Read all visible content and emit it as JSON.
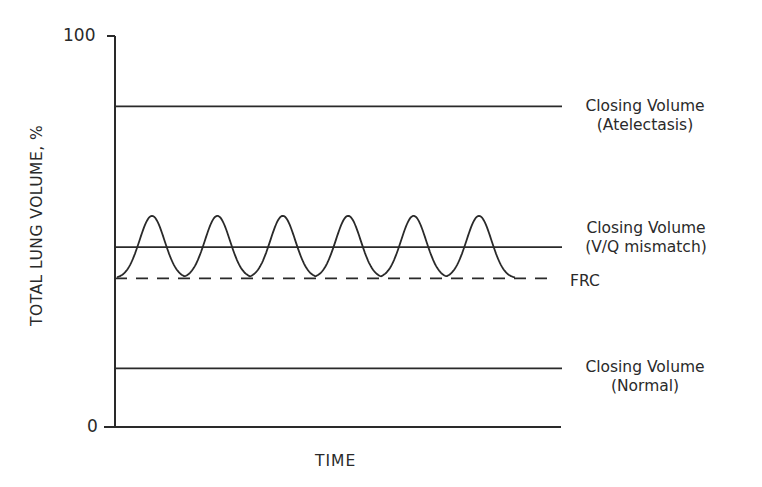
{
  "chart_data": {
    "type": "line",
    "title": "",
    "xlabel": "TIME",
    "ylabel": "TOTAL LUNG VOLUME, %",
    "ylim": [
      0,
      100
    ],
    "yticks": [
      "0",
      "100"
    ],
    "grid": false,
    "series": [
      {
        "name": "Closing Volume (Atelectasis)",
        "style": "solid",
        "value": 82
      },
      {
        "name": "Closing Volume (V/Q mismatch)",
        "style": "solid",
        "value": 46
      },
      {
        "name": "FRC",
        "style": "dashed",
        "value": 38
      },
      {
        "name": "Closing Volume (Normal)",
        "style": "solid",
        "value": 15
      },
      {
        "name": "Tidal breathing",
        "style": "solid",
        "type": "periodic",
        "trough": 38,
        "peak": 54,
        "cycles": 6
      }
    ],
    "annotations": [
      {
        "text": "Closing Volume",
        "subtext": "(Atelectasis)"
      },
      {
        "text": "Closing Volume",
        "subtext": "(V/Q mismatch)"
      },
      {
        "text": "FRC"
      },
      {
        "text": "Closing Volume",
        "subtext": "(Normal)"
      }
    ]
  },
  "labels": {
    "ytick_top": "100",
    "ytick_bottom": "0",
    "ylabel": "TOTAL LUNG VOLUME, %",
    "xlabel": "TIME",
    "atelectasis_1": "Closing Volume",
    "atelectasis_2": "(Atelectasis)",
    "vq_1": "Closing Volume",
    "vq_2": "(V/Q mismatch)",
    "frc": "FRC",
    "normal_1": "Closing Volume",
    "normal_2": "(Normal)"
  },
  "colors": {
    "ink": "#2a2a2a",
    "background": "#ffffff"
  }
}
